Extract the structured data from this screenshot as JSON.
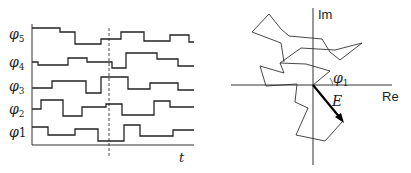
{
  "left_panel": {
    "title": "Phase time series",
    "axis_label_t": "t",
    "signals": [
      {
        "label": "φ5",
        "sym": "φ",
        "sub": "5",
        "points": "32,28 60,28 60,32 75,32 75,44 101,44 101,39 121,39 121,32 144,32 144,41 170,41 170,35 189,35 189,42 194,42"
      },
      {
        "label": "φ4",
        "sym": "φ",
        "sub": "4",
        "points": "32,62 38,62 38,65 68,65 68,58 87,58 87,62 112,62 112,68 126,68 126,53 157,53 157,59 178,59 178,66 194,66"
      },
      {
        "label": "φ3",
        "sym": "φ",
        "sub": "3",
        "points": "32,88 52,88 52,81 86,81 86,93 101,93 101,77 128,77 128,89 150,89 150,83 178,83 178,90 194,90"
      },
      {
        "label": "φ2",
        "sym": "φ",
        "sub": "2",
        "points": "32,109 41,109 41,100 63,100 63,116 82,116 82,107 106,107 106,104 122,104 122,115 154,115 154,101 170,101 170,107 194,107"
      },
      {
        "label": "φ1",
        "sym": "φ",
        "sub": "1",
        "points": "32,127 48,127 48,135 75,135 75,129 98,129 98,141 124,141 124,125 140,125 140,136 173,136 173,130 194,130"
      }
    ],
    "dashed_marker": "sampling time"
  },
  "right_panel": {
    "title": "Phasor random walk",
    "axis_im": "Im",
    "axis_re": "Re",
    "angle_label": "φ",
    "angle_sub": "1",
    "resultant_label": "E",
    "walk_points": "313,85 330,71 306,64 280,63 284,73 260,66 266,86 297,84 295,102 308,108 296,135 325,141 343,121 313,85",
    "walk_upper": "280,63 301,48 335,50 362,43 340,60 330,52 322,39 289,36 281,29 269,14 252,32 281,43 284,62"
  },
  "colors": {
    "line": "#222222",
    "background": "#ffffff"
  }
}
